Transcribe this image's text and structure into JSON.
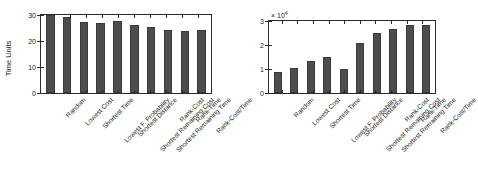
{
  "figure": {
    "background": "#ffffff",
    "bar_color": "#4d4d4d",
    "axis_color": "#2b2b2b"
  },
  "categories": [
    "Random",
    "Lowest Cost",
    "Shortest Time",
    "Lowest F. Probability",
    "Shortest Distance",
    "Shortest Remaining Cost",
    "Shortest Remaining Time",
    "Rank-Cost",
    "Rank-Time",
    "Rank-Cost/Time"
  ],
  "left_panel": {
    "ylabel": "Time Units",
    "yticks": [
      "0",
      "10",
      "20",
      "30"
    ]
  },
  "right_panel": {
    "exponent_prefix": "× 10",
    "exponent_power": "4",
    "yticks": [
      "0",
      "1",
      "2",
      "3"
    ]
  },
  "chart_data": [
    {
      "type": "bar",
      "title": "",
      "xlabel": "",
      "ylabel": "Time Units",
      "categories": [
        "Random",
        "Lowest Cost",
        "Shortest Time",
        "Lowest F. Probability",
        "Shortest Distance",
        "Shortest Remaining Cost",
        "Shortest Remaining Time",
        "Rank-Cost",
        "Rank-Time",
        "Rank-Cost/Time"
      ],
      "values": [
        35.0,
        34.0,
        32.0,
        31.5,
        32.2,
        30.7,
        29.5,
        28.5,
        28.0,
        28.2
      ],
      "ylim": [
        0,
        35
      ],
      "yticks": [
        0,
        10,
        20,
        30
      ],
      "grid": false,
      "legend": null,
      "notes": "First bar (Random) reaches/clips the top of the axis."
    },
    {
      "type": "bar",
      "title": "",
      "xlabel": "",
      "ylabel": "",
      "y_multiplier": 10000,
      "y_multiplier_label": "× 10^4",
      "categories": [
        "Random",
        "Lowest Cost",
        "Shortest Time",
        "Lowest F. Probability",
        "Shortest Distance",
        "Shortest Remaining Cost",
        "Shortest Remaining Time",
        "Rank-Cost",
        "Rank-Time",
        "Rank-Cost/Time"
      ],
      "values": [
        8700,
        10500,
        13300,
        15000,
        9900,
        20700,
        25000,
        26500,
        28200,
        28200
      ],
      "values_scaled": [
        0.87,
        1.05,
        1.33,
        1.5,
        0.99,
        2.07,
        2.5,
        2.65,
        2.82,
        2.82
      ],
      "ylim": [
        0,
        30000
      ],
      "yticks": [
        0,
        10000,
        20000,
        30000
      ],
      "grid": false,
      "legend": null
    }
  ]
}
